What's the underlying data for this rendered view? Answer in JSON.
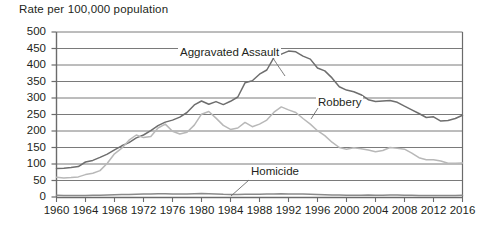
{
  "chart_data": {
    "type": "line",
    "title": "Rate per 100,000 population",
    "xlabel": "",
    "ylabel": "Rate per 100,000 population",
    "xlim": [
      1960,
      2016
    ],
    "ylim": [
      0,
      500
    ],
    "grid": true,
    "legend_position": "inline-annotations",
    "y_ticks": [
      "0",
      "50",
      "100",
      "150",
      "200",
      "250",
      "300",
      "350",
      "400",
      "450",
      "500"
    ],
    "y_tick_values": [
      0,
      50,
      100,
      150,
      200,
      250,
      300,
      350,
      400,
      450,
      500
    ],
    "x_ticks": [
      "1960",
      "1964",
      "1968",
      "1972",
      "1976",
      "1980",
      "1984",
      "1988",
      "1992",
      "1996",
      "2000",
      "2004",
      "2008",
      "2012",
      "2016"
    ],
    "x_tick_values": [
      1960,
      1964,
      1968,
      1972,
      1976,
      1980,
      1984,
      1988,
      1992,
      1996,
      2000,
      2004,
      2008,
      2012,
      2016
    ],
    "x": [
      1960,
      1961,
      1962,
      1963,
      1964,
      1965,
      1966,
      1967,
      1968,
      1969,
      1970,
      1971,
      1972,
      1973,
      1974,
      1975,
      1976,
      1977,
      1978,
      1979,
      1980,
      1981,
      1982,
      1983,
      1984,
      1985,
      1986,
      1987,
      1988,
      1989,
      1990,
      1991,
      1992,
      1993,
      1994,
      1995,
      1996,
      1997,
      1998,
      1999,
      2000,
      2001,
      2002,
      2003,
      2004,
      2005,
      2006,
      2007,
      2008,
      2009,
      2010,
      2011,
      2012,
      2013,
      2014,
      2015,
      2016
    ],
    "series": [
      {
        "name": "Aggravated Assault",
        "color": "#6e6e6e",
        "values": [
          86,
          87,
          89,
          92,
          106,
          111,
          120,
          130,
          143,
          155,
          165,
          179,
          188,
          201,
          216,
          227,
          233,
          242,
          256,
          279,
          291,
          281,
          289,
          280,
          290,
          303,
          346,
          352,
          372,
          385,
          423,
          433,
          442,
          440,
          427,
          418,
          391,
          382,
          361,
          334,
          324,
          319,
          310,
          295,
          289,
          291,
          292,
          287,
          275,
          264,
          253,
          241,
          243,
          230,
          232,
          238,
          248
        ]
      },
      {
        "name": "Robbery",
        "color": "#b8b8b8",
        "values": [
          60,
          58,
          59,
          61,
          68,
          72,
          80,
          102,
          131,
          148,
          172,
          188,
          180,
          183,
          209,
          221,
          199,
          191,
          196,
          218,
          251,
          259,
          239,
          217,
          205,
          209,
          226,
          213,
          221,
          233,
          257,
          273,
          264,
          256,
          238,
          221,
          201,
          186,
          166,
          150,
          145,
          149,
          146,
          142,
          137,
          141,
          150,
          148,
          145,
          133,
          119,
          113,
          113,
          109,
          102,
          102,
          103
        ]
      },
      {
        "name": "Homicide",
        "color": "#8a8a8a",
        "values": [
          5.1,
          4.8,
          4.6,
          4.6,
          4.9,
          5.1,
          5.6,
          6.2,
          6.9,
          7.3,
          7.9,
          8.6,
          9.0,
          9.4,
          9.8,
          9.6,
          8.8,
          8.8,
          9.0,
          9.8,
          10.2,
          9.8,
          9.1,
          8.3,
          7.9,
          8.0,
          8.6,
          8.3,
          8.5,
          8.7,
          9.4,
          9.8,
          9.3,
          9.5,
          9.0,
          8.2,
          7.4,
          6.8,
          6.3,
          5.7,
          5.5,
          5.6,
          5.6,
          5.7,
          5.5,
          5.6,
          5.8,
          5.7,
          5.4,
          5.0,
          4.8,
          4.7,
          4.7,
          4.5,
          4.4,
          4.9,
          5.3
        ]
      }
    ],
    "annotations": [
      {
        "text": "Aggravated Assault",
        "series": "Aggravated Assault"
      },
      {
        "text": "Robbery",
        "series": "Robbery"
      },
      {
        "text": "Homicide",
        "series": "Homicide"
      }
    ],
    "colors": {
      "assault": "#6e6e6e",
      "robbery": "#b8b8b8",
      "homicide": "#8a8a8a",
      "grid": "#7a7a7a",
      "axis": "#6b6b6b",
      "text": "#231f20"
    }
  }
}
